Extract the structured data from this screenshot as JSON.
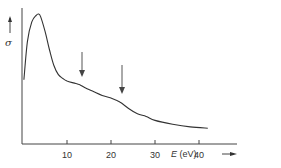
{
  "chart_data": {
    "type": "line",
    "title": "",
    "xlabel": "E (eV)",
    "ylabel": "σ",
    "xlim": [
      0,
      45
    ],
    "ylim": [
      0,
      1
    ],
    "x_ticks": [
      10,
      20,
      30,
      40
    ],
    "y_ticks": [],
    "grid": false,
    "legend": null,
    "series": [
      {
        "name": "σ(E)",
        "x": [
          0.2,
          1,
          2,
          3,
          3.5,
          4,
          5,
          6,
          7,
          8,
          9,
          10,
          12,
          13,
          14,
          16,
          18,
          20,
          22,
          24,
          26,
          28,
          30,
          34,
          38,
          42
        ],
        "y": [
          0.49,
          0.78,
          0.93,
          0.98,
          0.99,
          0.97,
          0.86,
          0.72,
          0.6,
          0.53,
          0.5,
          0.48,
          0.46,
          0.45,
          0.43,
          0.4,
          0.37,
          0.35,
          0.32,
          0.27,
          0.23,
          0.21,
          0.18,
          0.15,
          0.13,
          0.12
        ]
      }
    ],
    "annotations": [
      {
        "type": "arrow",
        "x": 13,
        "label": ""
      },
      {
        "type": "arrow",
        "x": 22,
        "label": ""
      }
    ]
  },
  "axis": {
    "ticks": [
      "10",
      "20",
      "30",
      "40"
    ],
    "x_label_var": "E",
    "x_label_unit": "(eV)",
    "y_label": "σ"
  }
}
